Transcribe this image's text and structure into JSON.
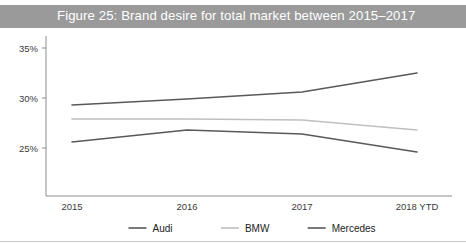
{
  "figure": {
    "title": "Figure 25: Brand desire for total market between 2015–2017",
    "title_bar_color": "#9a9a9a",
    "background_color": "#ffffff"
  },
  "chart_data": {
    "type": "line",
    "title": "Figure 25: Brand desire for total market between 2015–2017",
    "xlabel": "",
    "ylabel": "",
    "categories": [
      "2015",
      "2016",
      "2017",
      "2018 YTD"
    ],
    "series": [
      {
        "name": "Audi",
        "color": "#595959",
        "values": [
          29.3,
          29.9,
          30.6,
          32.5
        ]
      },
      {
        "name": "BMW",
        "color": "#bfbfbf",
        "values": [
          27.9,
          27.9,
          27.8,
          26.8
        ]
      },
      {
        "name": "Mercedes",
        "color": "#595959",
        "values": [
          25.6,
          26.8,
          26.4,
          24.6
        ]
      }
    ],
    "ylim": [
      22.0,
      36.0
    ],
    "yticks": [
      25,
      30,
      35
    ],
    "ytick_labels": [
      "25%",
      "30%",
      "35%"
    ],
    "grid": false,
    "legend_position": "bottom"
  },
  "axes": {
    "y_ticks": [
      {
        "label": "35%",
        "value": 35
      },
      {
        "label": "30%",
        "value": 30
      },
      {
        "label": "25%",
        "value": 25
      }
    ],
    "x_ticks": [
      {
        "label": "2015"
      },
      {
        "label": "2016"
      },
      {
        "label": "2017"
      },
      {
        "label": "2018 YTD"
      }
    ]
  },
  "legend": {
    "items": [
      {
        "label": "Audi",
        "color": "#595959"
      },
      {
        "label": "BMW",
        "color": "#bfbfbf"
      },
      {
        "label": "Mercedes",
        "color": "#595959"
      }
    ]
  }
}
